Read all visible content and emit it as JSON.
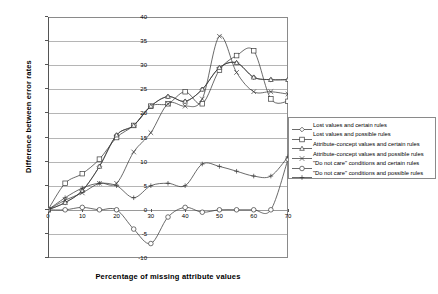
{
  "chart_data": {
    "type": "line",
    "title": "",
    "xlabel": "Percentage of missing attribute values",
    "ylabel": "Difference between error rates",
    "xlim": [
      0,
      70
    ],
    "ylim": [
      -10,
      40
    ],
    "xticks": [
      0,
      10,
      20,
      30,
      40,
      50,
      60,
      70
    ],
    "yticks": [
      -10,
      -5,
      0,
      5,
      10,
      15,
      20,
      25,
      30,
      35,
      40
    ],
    "grid": "horizontal",
    "legend_position": "right",
    "x": [
      0,
      5,
      10,
      15,
      20,
      25,
      30,
      35,
      40,
      45,
      50,
      55,
      60,
      65,
      70
    ],
    "series": [
      {
        "name": "Lost values and certain rules",
        "marker": "diamond",
        "values": [
          0,
          1.5,
          4,
          9,
          15.5,
          17.5,
          21.5,
          23.5,
          22.5,
          25,
          29.5,
          30.5,
          27.5,
          27,
          27
        ]
      },
      {
        "name": "Lost values and possible rules",
        "marker": "square",
        "values": [
          0,
          5.5,
          7.5,
          10.5,
          15,
          17.5,
          21.5,
          22,
          24.5,
          22,
          29,
          32,
          33,
          23,
          22.5
        ]
      },
      {
        "name": "Attribute-concept values and certain rules",
        "marker": "triangle",
        "values": [
          0,
          1.5,
          4,
          9,
          15.5,
          17.5,
          21.5,
          23.5,
          22.5,
          25,
          29.5,
          30.5,
          27.5,
          27,
          27
        ]
      },
      {
        "name": "Attribute-concept values and possible rules",
        "marker": "cross",
        "values": [
          0,
          2,
          3.5,
          5.5,
          5.5,
          12,
          16,
          22,
          21.5,
          23,
          36,
          28.5,
          24.5,
          24.5,
          24
        ]
      },
      {
        "name": "\"Do not care\" conditions and certain rules",
        "marker": "circle",
        "values": [
          0,
          0,
          0.5,
          0,
          0,
          -4,
          -7,
          -1.5,
          0.5,
          -0.5,
          0,
          0,
          0,
          0,
          10.5
        ]
      },
      {
        "name": "\"Do not care\" conditions and possible rules",
        "marker": "plus",
        "values": [
          0,
          2.5,
          4.5,
          5.5,
          5,
          2.5,
          5,
          5.5,
          5,
          9.5,
          9,
          8,
          7,
          7,
          11
        ]
      }
    ]
  },
  "legend": {
    "items": [
      {
        "label": "Lost values and certain rules",
        "marker": "diamond"
      },
      {
        "label": "Lost values and possible rules",
        "marker": "square"
      },
      {
        "label": "Attribute-concept values and certain rules",
        "marker": "triangle"
      },
      {
        "label": "Attribute-concept values and possible rules",
        "marker": "cross"
      },
      {
        "label": "\"Do not care\" conditions and certain rules",
        "marker": "circle"
      },
      {
        "label": "\"Do not care\" conditions and possible rules",
        "marker": "plus"
      }
    ]
  }
}
